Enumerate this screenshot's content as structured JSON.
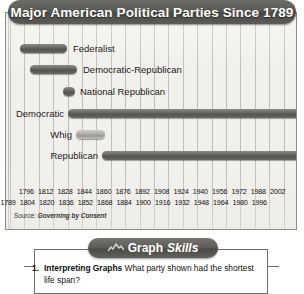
{
  "figure": {
    "title": "Major American Political Parties Since 1789",
    "source_prefix": "Source:",
    "source_title": "Governing by Consent"
  },
  "chart_data": {
    "type": "bar",
    "orientation": "horizontal",
    "title": "Major American Political Parties Since 1789",
    "xlabel": "",
    "ylabel": "",
    "xlim": [
      1789,
      2004
    ],
    "grid": true,
    "legend": "none",
    "note": "Horizontal timeline (Gantt-style) spans showing the lifetime of each major U.S. political party.",
    "categories": [
      "Federalist",
      "Democratic-Republican",
      "National Republican",
      "Democratic",
      "Whig",
      "Republican"
    ],
    "spans": [
      {
        "party": "Federalist",
        "start": 1789,
        "end": 1820,
        "label_side": "right"
      },
      {
        "party": "Democratic-Republican",
        "start": 1796,
        "end": 1828,
        "label_side": "right"
      },
      {
        "party": "National Republican",
        "start": 1828,
        "end": 1836,
        "label_side": "right"
      },
      {
        "party": "Democratic",
        "start": 1828,
        "end": 2004,
        "label_side": "left"
      },
      {
        "party": "Whig",
        "start": 1834,
        "end": 1854,
        "label_side": "left"
      },
      {
        "party": "Republican",
        "start": 1854,
        "end": 2004,
        "label_side": "left"
      }
    ],
    "axis_ticks_upper": [
      "1796",
      "1812",
      "1828",
      "1844",
      "1860",
      "1876",
      "1892",
      "1908",
      "1924",
      "1940",
      "1956",
      "1972",
      "1988",
      "2002"
    ],
    "axis_ticks_lower": [
      "1789",
      "1804",
      "1820",
      "1836",
      "1852",
      "1868",
      "1884",
      "1900",
      "1916",
      "1932",
      "1948",
      "1964",
      "1980",
      "1996"
    ]
  },
  "skills": {
    "banner_word_1": "Graph",
    "banner_word_2": "Skills",
    "question_number": "1.",
    "question_term": "Interpreting Graphs",
    "question_text": "What party shown had the shortest life span?"
  }
}
